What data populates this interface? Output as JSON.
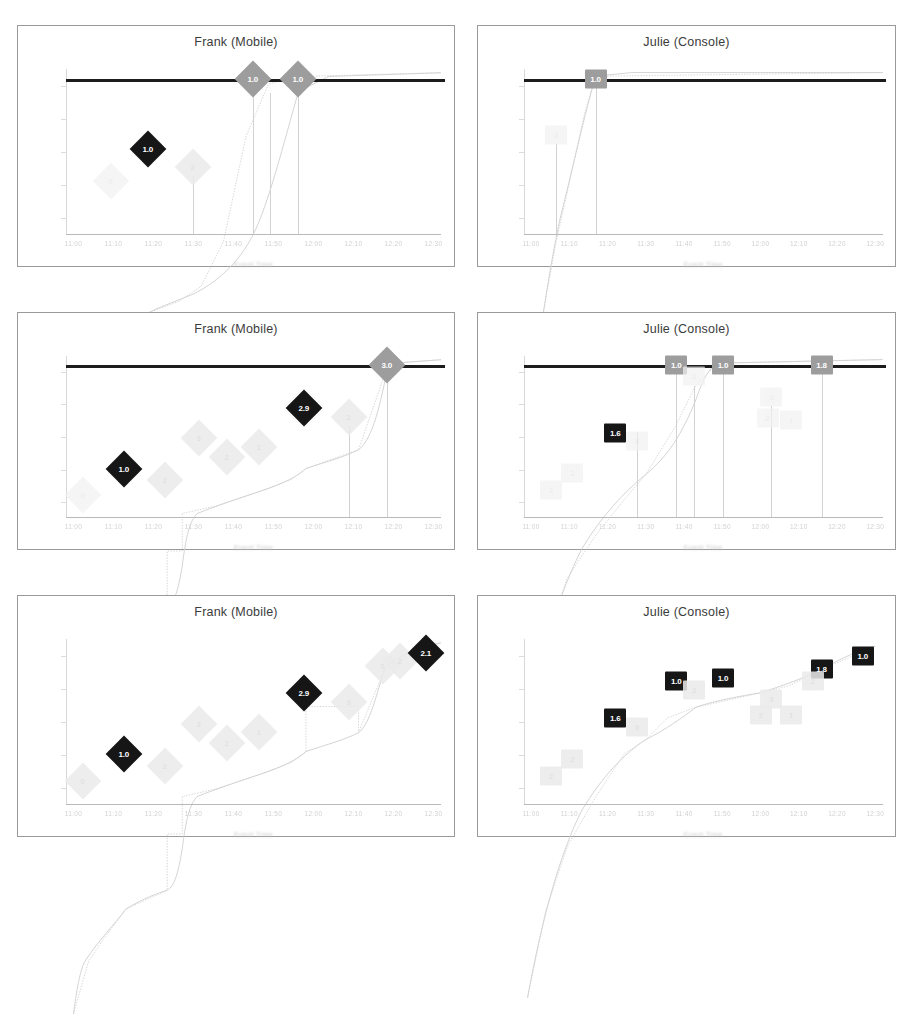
{
  "figure": {
    "layout": "2 columns x 3 rows of line-chart panels",
    "columns": [
      "Frank (Mobile)",
      "Julie (Console)"
    ],
    "rows": 3
  },
  "panels": [
    {
      "id": "frank-row1",
      "title": "Frank (Mobile)",
      "marker_shape": "diamond",
      "has_threshold_line": true,
      "threshold_y": 1.0,
      "xlabel": "Event Time",
      "labeled_markers": [
        {
          "x": 0.12,
          "y": 0.3,
          "label": "0",
          "style": "faint"
        },
        {
          "x": 0.22,
          "y": 0.52,
          "label": "1.0",
          "style": "dark"
        },
        {
          "x": 0.34,
          "y": 0.4,
          "label": "2",
          "style": "ghost"
        },
        {
          "x": 0.5,
          "y": 1.0,
          "label": "1.0",
          "style": "grey"
        },
        {
          "x": 0.62,
          "y": 1.0,
          "label": "1.0",
          "style": "grey"
        }
      ]
    },
    {
      "id": "julie-row1",
      "title": "Julie (Console)",
      "marker_shape": "square",
      "has_threshold_line": true,
      "threshold_y": 1.0,
      "xlabel": "Event Time",
      "labeled_markers": [
        {
          "x": 0.09,
          "y": 0.62,
          "label": "2",
          "style": "faint"
        },
        {
          "x": 0.2,
          "y": 1.0,
          "label": "1.0",
          "style": "grey"
        }
      ]
    },
    {
      "id": "frank-row2",
      "title": "Frank (Mobile)",
      "marker_shape": "diamond",
      "has_threshold_line": true,
      "threshold_y": 1.0,
      "xlabel": "Event Time",
      "labeled_markers": [
        {
          "x": 0.045,
          "y": 0.1,
          "label": "0",
          "style": "faint"
        },
        {
          "x": 0.155,
          "y": 0.28,
          "label": "1.0",
          "style": "dark"
        },
        {
          "x": 0.265,
          "y": 0.2,
          "label": "2",
          "style": "ghost"
        },
        {
          "x": 0.355,
          "y": 0.49,
          "label": "3",
          "style": "ghost"
        },
        {
          "x": 0.43,
          "y": 0.36,
          "label": "2",
          "style": "ghost"
        },
        {
          "x": 0.515,
          "y": 0.43,
          "label": "1",
          "style": "ghost"
        },
        {
          "x": 0.635,
          "y": 0.7,
          "label": "2.9",
          "style": "dark"
        },
        {
          "x": 0.755,
          "y": 0.64,
          "label": "2",
          "style": "ghost"
        },
        {
          "x": 0.855,
          "y": 1.0,
          "label": "3.0",
          "style": "grey"
        }
      ]
    },
    {
      "id": "julie-row2",
      "title": "Julie (Console)",
      "marker_shape": "square",
      "has_threshold_line": true,
      "threshold_y": 1.0,
      "xlabel": "Event Time",
      "labeled_markers": [
        {
          "x": 0.075,
          "y": 0.13,
          "label": "2",
          "style": "faint"
        },
        {
          "x": 0.135,
          "y": 0.25,
          "label": "2",
          "style": "faint"
        },
        {
          "x": 0.255,
          "y": 0.53,
          "label": "1.6",
          "style": "dark"
        },
        {
          "x": 0.315,
          "y": 0.47,
          "label": "3",
          "style": "faint"
        },
        {
          "x": 0.425,
          "y": 1.0,
          "label": "1.0",
          "style": "grey"
        },
        {
          "x": 0.475,
          "y": 0.92,
          "label": "2",
          "style": "faint"
        },
        {
          "x": 0.555,
          "y": 1.0,
          "label": "1.0",
          "style": "grey"
        },
        {
          "x": 0.69,
          "y": 0.78,
          "label": "3",
          "style": "faint"
        },
        {
          "x": 0.68,
          "y": 0.63,
          "label": "2",
          "style": "faint"
        },
        {
          "x": 0.745,
          "y": 0.62,
          "label": "1",
          "style": "faint"
        },
        {
          "x": 0.83,
          "y": 1.0,
          "label": "1.8",
          "style": "grey"
        }
      ]
    },
    {
      "id": "frank-row3",
      "title": "Frank (Mobile)",
      "marker_shape": "diamond",
      "has_threshold_line": false,
      "xlabel": "Event Time",
      "labeled_markers": [
        {
          "x": 0.045,
          "y": 0.1,
          "label": "0",
          "style": "ghost"
        },
        {
          "x": 0.155,
          "y": 0.28,
          "label": "1.0",
          "style": "dark"
        },
        {
          "x": 0.265,
          "y": 0.2,
          "label": "2",
          "style": "ghost"
        },
        {
          "x": 0.355,
          "y": 0.49,
          "label": "3",
          "style": "ghost"
        },
        {
          "x": 0.43,
          "y": 0.36,
          "label": "2",
          "style": "ghost"
        },
        {
          "x": 0.515,
          "y": 0.43,
          "label": "1",
          "style": "ghost"
        },
        {
          "x": 0.635,
          "y": 0.7,
          "label": "2.9",
          "style": "dark"
        },
        {
          "x": 0.755,
          "y": 0.64,
          "label": "3",
          "style": "ghost"
        },
        {
          "x": 0.845,
          "y": 0.88,
          "label": "0",
          "style": "ghost"
        },
        {
          "x": 0.89,
          "y": 0.92,
          "label": "2",
          "style": "ghost"
        },
        {
          "x": 0.96,
          "y": 0.97,
          "label": "2.1",
          "style": "dark"
        }
      ]
    },
    {
      "id": "julie-row3",
      "title": "Julie (Console)",
      "marker_shape": "square",
      "has_threshold_line": false,
      "xlabel": "Event Time",
      "labeled_markers": [
        {
          "x": 0.075,
          "y": 0.13,
          "label": "2",
          "style": "ghost"
        },
        {
          "x": 0.135,
          "y": 0.25,
          "label": "2",
          "style": "ghost"
        },
        {
          "x": 0.255,
          "y": 0.53,
          "label": "1.6",
          "style": "dark"
        },
        {
          "x": 0.315,
          "y": 0.47,
          "label": "3",
          "style": "ghost"
        },
        {
          "x": 0.425,
          "y": 0.78,
          "label": "1.0",
          "style": "dark"
        },
        {
          "x": 0.475,
          "y": 0.72,
          "label": "2",
          "style": "ghost"
        },
        {
          "x": 0.555,
          "y": 0.8,
          "label": "1.0",
          "style": "dark"
        },
        {
          "x": 0.69,
          "y": 0.66,
          "label": "3",
          "style": "ghost"
        },
        {
          "x": 0.66,
          "y": 0.55,
          "label": "2",
          "style": "ghost"
        },
        {
          "x": 0.745,
          "y": 0.55,
          "label": "1",
          "style": "ghost"
        },
        {
          "x": 0.83,
          "y": 0.86,
          "label": "1.8",
          "style": "dark"
        },
        {
          "x": 0.805,
          "y": 0.78,
          "label": "2",
          "style": "ghost"
        },
        {
          "x": 0.945,
          "y": 0.95,
          "label": "1.0",
          "style": "dark"
        }
      ]
    }
  ],
  "chart_data": [
    {
      "type": "line",
      "panel": "frank-row1",
      "title": "Frank (Mobile)",
      "xlabel": "Event Time",
      "ylabel": "",
      "grid": false,
      "legend": "none",
      "threshold_line": 1.0,
      "series": [
        {
          "name": "Frank (Mobile) cumulative",
          "x": [
            0.02,
            0.12,
            0.22,
            0.34,
            0.42,
            0.5,
            0.62
          ],
          "y": [
            0.0,
            0.3,
            0.52,
            0.55,
            0.85,
            1.0,
            1.0
          ]
        }
      ],
      "point_labels": [
        "",
        "0",
        "1.0",
        "2",
        "",
        "1.0",
        "1.0"
      ]
    },
    {
      "type": "line",
      "panel": "julie-row1",
      "title": "Julie (Console)",
      "xlabel": "Event Time",
      "ylabel": "",
      "grid": false,
      "legend": "none",
      "threshold_line": 1.0,
      "series": [
        {
          "name": "Julie (Console) cumulative",
          "x": [
            0.01,
            0.09,
            0.2
          ],
          "y": [
            0.0,
            0.62,
            1.0
          ]
        }
      ],
      "point_labels": [
        "",
        "2",
        "1.0"
      ]
    },
    {
      "type": "line",
      "panel": "frank-row2",
      "title": "Frank (Mobile)",
      "xlabel": "Event Time",
      "ylabel": "",
      "grid": false,
      "legend": "none",
      "threshold_line": 1.0,
      "series": [
        {
          "name": "Frank (Mobile) cumulative",
          "x": [
            0.02,
            0.045,
            0.155,
            0.265,
            0.3,
            0.33,
            0.355,
            0.515,
            0.635,
            0.755,
            0.855
          ],
          "y": [
            0.0,
            0.1,
            0.28,
            0.3,
            0.31,
            0.52,
            0.56,
            0.63,
            0.7,
            0.72,
            1.0
          ]
        }
      ],
      "point_labels": [
        "",
        "0",
        "1.0",
        "2",
        "",
        "",
        "3",
        "1",
        "2.9",
        "2",
        "3.0"
      ]
    },
    {
      "type": "line",
      "panel": "julie-row2",
      "title": "Julie (Console)",
      "xlabel": "Event Time",
      "ylabel": "",
      "grid": false,
      "legend": "none",
      "threshold_line": 1.0,
      "series": [
        {
          "name": "Julie (Console) cumulative",
          "x": [
            0.01,
            0.075,
            0.135,
            0.255,
            0.315,
            0.38,
            0.425,
            0.555,
            0.745,
            0.83
          ],
          "y": [
            0.0,
            0.13,
            0.25,
            0.53,
            0.6,
            0.72,
            1.0,
            1.0,
            0.62,
            1.0
          ]
        }
      ],
      "point_labels": [
        "",
        "2",
        "2",
        "1.6",
        "3",
        "",
        "1.0",
        "1.0",
        "1",
        "1.8"
      ]
    },
    {
      "type": "line",
      "panel": "frank-row3",
      "title": "Frank (Mobile)",
      "xlabel": "Event Time",
      "ylabel": "",
      "grid": false,
      "legend": "none",
      "threshold_line": null,
      "series": [
        {
          "name": "Frank (Mobile) cumulative",
          "x": [
            0.02,
            0.045,
            0.155,
            0.265,
            0.3,
            0.33,
            0.355,
            0.515,
            0.635,
            0.755,
            0.8,
            0.845,
            0.96
          ],
          "y": [
            0.0,
            0.1,
            0.28,
            0.3,
            0.31,
            0.52,
            0.56,
            0.63,
            0.7,
            0.72,
            0.74,
            0.88,
            0.97
          ]
        }
      ],
      "point_labels": [
        "",
        "0",
        "1.0",
        "2",
        "",
        "",
        "3",
        "1",
        "2.9",
        "3",
        "",
        "0",
        "2.1"
      ]
    },
    {
      "type": "line",
      "panel": "julie-row3",
      "title": "Julie (Console)",
      "xlabel": "Event Time",
      "ylabel": "",
      "grid": false,
      "legend": "none",
      "threshold_line": null,
      "series": [
        {
          "name": "Julie (Console) cumulative",
          "x": [
            0.01,
            0.075,
            0.135,
            0.255,
            0.315,
            0.38,
            0.425,
            0.555,
            0.69,
            0.745,
            0.83,
            0.945
          ],
          "y": [
            0.0,
            0.13,
            0.25,
            0.53,
            0.58,
            0.62,
            0.78,
            0.8,
            0.8,
            0.82,
            0.86,
            0.95
          ]
        }
      ],
      "point_labels": [
        "",
        "2",
        "2",
        "1.6",
        "3",
        "",
        "1.0",
        "1.0",
        "3",
        "1",
        "1.8",
        "1.0"
      ]
    }
  ],
  "axis_ticks": {
    "note": "tick labels are illegible in the scan",
    "smudges": [
      "11:00",
      "11:10",
      "11:20",
      "11:30",
      "11:40",
      "11:50",
      "12:00",
      "12:10",
      "12:20",
      "12:30"
    ]
  }
}
